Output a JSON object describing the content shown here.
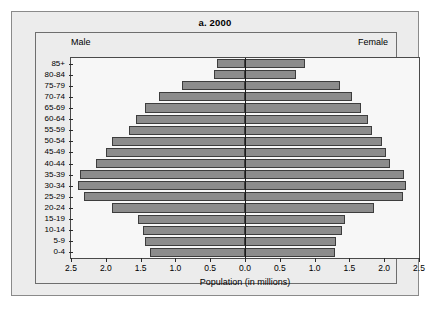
{
  "figure": {
    "title": "a. 2000",
    "left_label": "Male",
    "right_label": "Female",
    "xaxis_title": "Population (in millions)",
    "bar_color": "#8c8c8c",
    "bar_edge_color": "#3d3d3d",
    "panel_bg": "#ececec",
    "plot_bg": "#f7f7f7"
  },
  "chart_data": {
    "type": "bar",
    "subtype": "population-pyramid",
    "title": "a. 2000",
    "xlabel": "Population (in millions)",
    "ylabel": "",
    "xlim": [
      -2.5,
      2.5
    ],
    "xticks": [
      2.5,
      2.0,
      1.5,
      1.0,
      0.5,
      0.0,
      0.5,
      1.0,
      1.5,
      2.0,
      2.5
    ],
    "xtick_labels": [
      "2.5",
      "2.0",
      "1.5",
      "1.0",
      "0.5",
      "0.0",
      "0.5",
      "1.0",
      "1.5",
      "2.0",
      "2.5"
    ],
    "grid": false,
    "legend": [
      "Male",
      "Female"
    ],
    "legend_position": "top-inside-corners",
    "categories": [
      "85+",
      "80-84",
      "75-79",
      "70-74",
      "65-69",
      "60-64",
      "55-59",
      "50-54",
      "45-49",
      "40-44",
      "35-39",
      "30-34",
      "25-29",
      "20-24",
      "15-19",
      "10-14",
      "5-9",
      "0-4"
    ],
    "series": [
      {
        "name": "Male",
        "side": "left",
        "values": [
          0.4,
          0.44,
          0.91,
          1.23,
          1.43,
          1.57,
          1.66,
          1.91,
          2.0,
          2.14,
          2.37,
          2.4,
          2.31,
          1.91,
          1.54,
          1.47,
          1.43,
          1.37
        ]
      },
      {
        "name": "Female",
        "side": "right",
        "values": [
          0.86,
          0.73,
          1.37,
          1.54,
          1.67,
          1.77,
          1.83,
          1.97,
          2.03,
          2.09,
          2.29,
          2.31,
          2.27,
          1.86,
          1.43,
          1.39,
          1.31,
          1.29
        ]
      }
    ]
  }
}
